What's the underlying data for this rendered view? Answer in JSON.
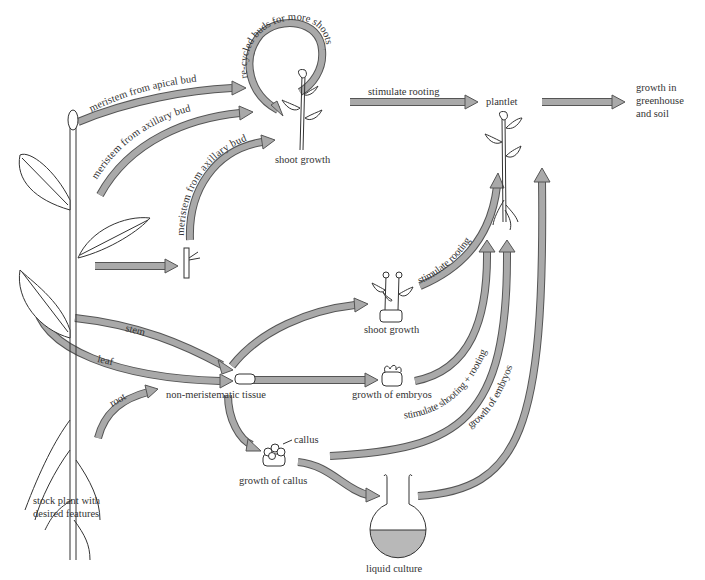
{
  "diagram": {
    "nodes": {
      "stock_plant": "stock plant with\ndesired features",
      "stock_plant_line1": "stock plant with",
      "stock_plant_line2": "desired features",
      "shoot_growth_top": "shoot growth",
      "plantlet": "plantlet",
      "greenhouse_line1": "growth in",
      "greenhouse_line2": "greenhouse",
      "greenhouse_line3": "and soil",
      "non_meristematic": "non-meristematic tissue",
      "shoot_growth_mid": "shoot growth",
      "growth_of_embryos": "growth of embryos",
      "callus": "callus",
      "growth_of_callus": "growth of callus",
      "liquid_culture": "liquid culture"
    },
    "edges": {
      "recycled": "re-cycled buds for more shoots",
      "apical": "meristem from apical bud",
      "axillary1": "meristem from axillary bud",
      "axillary2": "meristem from axillary bud",
      "stimulate_rooting_top": "stimulate rooting",
      "stimulate_rooting_mid": "stimulate rooting",
      "stem": "stem",
      "leaf": "leaf",
      "root": "root",
      "shooting_rooting": "stimulate shooting + rooting",
      "embryos_from_culture": "growth of embryos"
    },
    "colors": {
      "arrow_fill": "#a9a9a9",
      "arrow_outline": "#555555",
      "liquid": "#b8b8b8",
      "text": "#333333"
    }
  }
}
